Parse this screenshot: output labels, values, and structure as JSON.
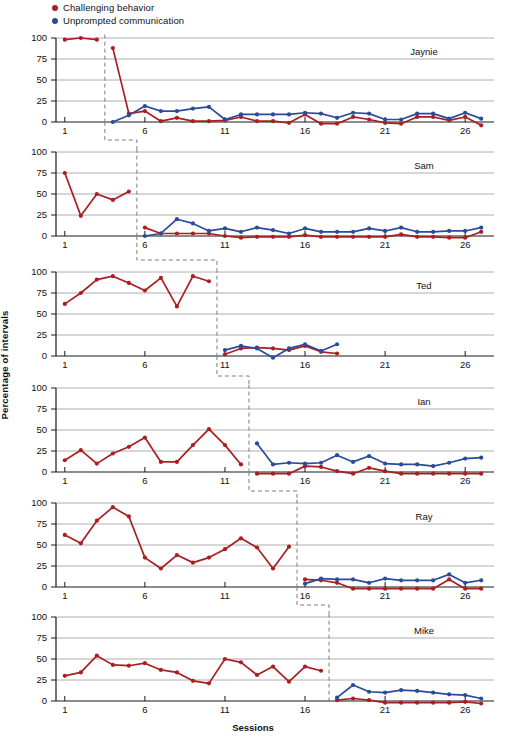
{
  "figure": {
    "ylabel": "Percentage of intervals",
    "xlabel": "Sessions",
    "legend": [
      {
        "label": "Challenging behavior",
        "color": "#a81f22",
        "key": "challenging"
      },
      {
        "label": "Unprompted communication",
        "color": "#2a4b9b",
        "key": "unprompted"
      }
    ]
  },
  "chart_data": {
    "type": "line",
    "title": "",
    "subtitle": "",
    "xlabel": "Sessions",
    "ylabel": "Percentage of intervals",
    "xlim": [
      0.2,
      27.8
    ],
    "ylim": [
      -8,
      108
    ],
    "yticks": [
      0,
      25,
      50,
      75,
      100
    ],
    "xticks": [
      1,
      6,
      11,
      16,
      21,
      26
    ],
    "grid": "horizontal",
    "legend_position": "top-left",
    "design": "multiple-baseline across participants",
    "series_colors": {
      "Challenging behavior": "#a81f22",
      "Unprompted communication": "#2a4b9b"
    },
    "panels": [
      {
        "name": "Jaynie",
        "phase_change_after_session": 3,
        "baseline": {
          "Challenging behavior": {
            "x": [
              1,
              2,
              3
            ],
            "y": [
              98,
              100,
              98
            ]
          },
          "Unprompted communication": {
            "x": [],
            "y": []
          }
        },
        "intervention": {
          "Challenging behavior": {
            "x": [
              4,
              5,
              6,
              7,
              8,
              9,
              10,
              11,
              12,
              13,
              14,
              15,
              16,
              17,
              18,
              19,
              20,
              21,
              22,
              23,
              24,
              25,
              26,
              27
            ],
            "y": [
              88,
              10,
              13,
              1,
              5,
              1,
              1,
              2,
              6,
              1,
              1,
              -1,
              9,
              -2,
              -2,
              6,
              3,
              -1,
              -2,
              6,
              6,
              2,
              6,
              -4
            ]
          },
          "Unprompted communication": {
            "x": [
              4,
              5,
              6,
              7,
              8,
              9,
              10,
              11,
              12,
              13,
              14,
              15,
              16,
              17,
              18,
              19,
              20,
              21,
              22,
              23,
              24,
              25,
              26,
              27
            ],
            "y": [
              0,
              8,
              19,
              13,
              13,
              16,
              18,
              3,
              9,
              9,
              9,
              9,
              11,
              10,
              5,
              11,
              10,
              3,
              3,
              10,
              10,
              4,
              11,
              4
            ]
          }
        }
      },
      {
        "name": "Sam",
        "phase_change_after_session": 5,
        "baseline": {
          "Challenging behavior": {
            "x": [
              1,
              2,
              3,
              4,
              5
            ],
            "y": [
              75,
              24,
              50,
              43,
              53
            ]
          },
          "Unprompted communication": {
            "x": [],
            "y": []
          }
        },
        "intervention": {
          "Challenging behavior": {
            "x": [
              6,
              7,
              8,
              9,
              10,
              11,
              12,
              13,
              14,
              15,
              16,
              17,
              18,
              19,
              20,
              21,
              22,
              23,
              24,
              25,
              26,
              27
            ],
            "y": [
              10,
              3,
              3,
              3,
              3,
              0,
              -2,
              -1,
              -1,
              -1,
              1,
              -1,
              -1,
              -1,
              -1,
              -1,
              2,
              -1,
              -1,
              -2,
              -2,
              5
            ]
          },
          "Unprompted communication": {
            "x": [
              6,
              7,
              8,
              9,
              10,
              11,
              12,
              13,
              14,
              15,
              16,
              17,
              18,
              19,
              20,
              21,
              22,
              23,
              24,
              25,
              26,
              27
            ],
            "y": [
              0,
              3,
              20,
              15,
              6,
              9,
              5,
              10,
              7,
              3,
              9,
              5,
              5,
              5,
              9,
              6,
              10,
              5,
              5,
              6,
              6,
              10
            ]
          }
        }
      },
      {
        "name": "Ted",
        "phase_change_after_session": 10,
        "baseline": {
          "Challenging behavior": {
            "x": [
              1,
              2,
              3,
              4,
              5,
              6,
              7,
              8,
              9,
              10
            ],
            "y": [
              62,
              75,
              91,
              95,
              87,
              78,
              93,
              59,
              95,
              89
            ]
          },
          "Unprompted communication": {
            "x": [],
            "y": []
          }
        },
        "intervention": {
          "Challenging behavior": {
            "x": [
              11,
              12,
              13,
              14,
              15,
              16,
              17,
              18
            ],
            "y": [
              2,
              9,
              10,
              9,
              7,
              12,
              5,
              3
            ]
          },
          "Unprompted communication": {
            "x": [
              11,
              12,
              13,
              14,
              15,
              16,
              17,
              18
            ],
            "y": [
              7,
              12,
              9,
              -2,
              9,
              14,
              6,
              14
            ]
          }
        }
      },
      {
        "name": "Ian",
        "phase_change_after_session": 12,
        "baseline": {
          "Challenging behavior": {
            "x": [
              1,
              2,
              3,
              4,
              5,
              6,
              7,
              8,
              9,
              10,
              11,
              12
            ],
            "y": [
              14,
              26,
              10,
              22,
              30,
              41,
              12,
              12,
              32,
              51,
              32,
              9
            ]
          },
          "Unprompted communication": {
            "x": [],
            "y": []
          }
        },
        "intervention": {
          "Challenging behavior": {
            "x": [
              13,
              14,
              15,
              16,
              17,
              18,
              19,
              20,
              21,
              22,
              23,
              24,
              25,
              26,
              27
            ],
            "y": [
              -2,
              -2,
              -2,
              7,
              6,
              1,
              -2,
              5,
              1,
              -2,
              -2,
              -2,
              -2,
              -2,
              -2
            ]
          },
          "Unprompted communication": {
            "x": [
              13,
              14,
              15,
              16,
              17,
              18,
              19,
              20,
              21,
              22,
              23,
              24,
              25,
              26,
              27
            ],
            "y": [
              34,
              9,
              11,
              10,
              11,
              20,
              12,
              19,
              10,
              9,
              9,
              7,
              11,
              16,
              17
            ]
          }
        }
      },
      {
        "name": "Ray",
        "phase_change_after_session": 15,
        "baseline": {
          "Challenging behavior": {
            "x": [
              1,
              2,
              3,
              4,
              5,
              6,
              7,
              8,
              9,
              10,
              11,
              12,
              13,
              14,
              15
            ],
            "y": [
              62,
              52,
              79,
              95,
              84,
              35,
              22,
              38,
              29,
              35,
              45,
              58,
              47,
              22,
              48
            ]
          },
          "Unprompted communication": {
            "x": [],
            "y": []
          }
        },
        "intervention": {
          "Challenging behavior": {
            "x": [
              16,
              17,
              18,
              19,
              20,
              21,
              22,
              23,
              24,
              25,
              26,
              27
            ],
            "y": [
              9,
              8,
              5,
              -2,
              -2,
              -2,
              -2,
              -2,
              -2,
              9,
              -2,
              -2
            ]
          },
          "Unprompted communication": {
            "x": [
              16,
              17,
              18,
              19,
              20,
              21,
              22,
              23,
              24,
              25,
              26,
              27
            ],
            "y": [
              4,
              10,
              9,
              9,
              5,
              10,
              8,
              8,
              8,
              15,
              5,
              8
            ]
          }
        }
      },
      {
        "name": "Mike",
        "phase_change_after_session": 17,
        "baseline": {
          "Challenging behavior": {
            "x": [
              1,
              2,
              3,
              4,
              5,
              6,
              7,
              8,
              9,
              10,
              11,
              12,
              13,
              14,
              15,
              16,
              17
            ],
            "y": [
              30,
              34,
              54,
              43,
              42,
              45,
              37,
              34,
              24,
              21,
              50,
              46,
              31,
              41,
              23,
              41,
              36
            ]
          },
          "Unprompted communication": {
            "x": [],
            "y": []
          }
        },
        "intervention": {
          "Challenging behavior": {
            "x": [
              18,
              19,
              20,
              21,
              22,
              23,
              24,
              25,
              26,
              27
            ],
            "y": [
              1,
              3,
              1,
              -2,
              -2,
              -2,
              -2,
              -2,
              -1,
              -3
            ]
          },
          "Unprompted communication": {
            "x": [
              18,
              19,
              20,
              21,
              22,
              23,
              24,
              25,
              26,
              27
            ],
            "y": [
              4,
              19,
              11,
              10,
              13,
              12,
              10,
              8,
              7,
              3
            ]
          }
        }
      }
    ]
  }
}
